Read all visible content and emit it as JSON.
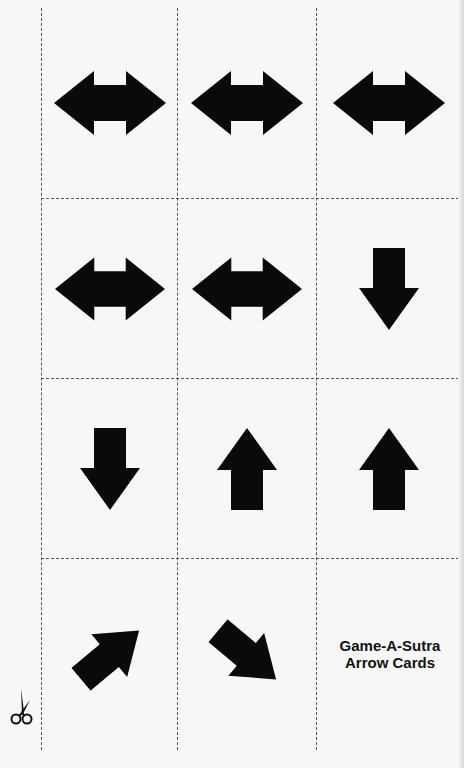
{
  "sheet": {
    "title_line1": "Game-A-Sutra",
    "title_line2": "Arrow Cards",
    "cut_icon": "scissors-icon",
    "arrow_color": "#0a0a0a",
    "line_color": "#555555"
  },
  "cards": [
    {
      "row": 1,
      "col": 1,
      "icon": "double-arrow-horizontal-icon"
    },
    {
      "row": 1,
      "col": 2,
      "icon": "double-arrow-horizontal-icon"
    },
    {
      "row": 1,
      "col": 3,
      "icon": "double-arrow-horizontal-icon"
    },
    {
      "row": 2,
      "col": 1,
      "icon": "double-arrow-horizontal-icon"
    },
    {
      "row": 2,
      "col": 2,
      "icon": "double-arrow-horizontal-icon"
    },
    {
      "row": 2,
      "col": 3,
      "icon": "arrow-down-icon"
    },
    {
      "row": 3,
      "col": 1,
      "icon": "arrow-down-icon"
    },
    {
      "row": 3,
      "col": 2,
      "icon": "arrow-up-icon"
    },
    {
      "row": 3,
      "col": 3,
      "icon": "arrow-up-icon"
    },
    {
      "row": 4,
      "col": 1,
      "icon": "arrow-up-right-icon"
    },
    {
      "row": 4,
      "col": 2,
      "icon": "arrow-down-right-icon"
    },
    {
      "row": 4,
      "col": 3,
      "icon": "title-card"
    }
  ]
}
